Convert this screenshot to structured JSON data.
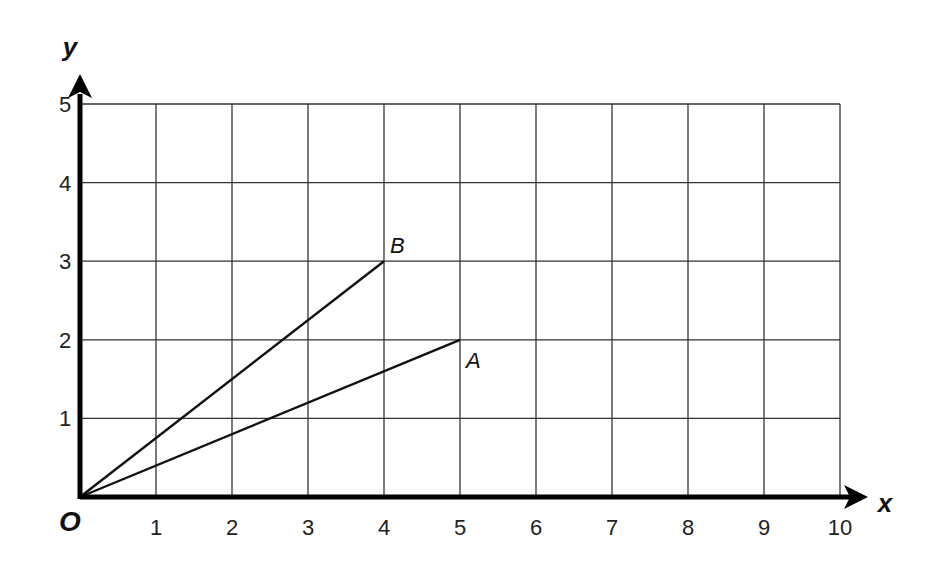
{
  "diagram": {
    "type": "coordinate-grid",
    "x_axis": {
      "label": "x",
      "min": 0,
      "max": 10,
      "ticks": [
        "1",
        "2",
        "3",
        "4",
        "5",
        "6",
        "7",
        "8",
        "9",
        "10"
      ]
    },
    "y_axis": {
      "label": "y",
      "min": 0,
      "max": 5,
      "ticks": [
        "1",
        "2",
        "3",
        "4",
        "5"
      ]
    },
    "origin_label": "O",
    "points": [
      {
        "label": "B",
        "x": 4,
        "y": 3
      },
      {
        "label": "A",
        "x": 5,
        "y": 2
      }
    ],
    "segments": [
      {
        "from": "O",
        "to": "B"
      },
      {
        "from": "O",
        "to": "A"
      }
    ],
    "colors": {
      "grid": "#333333",
      "axis": "#000000",
      "line": "#111111"
    }
  }
}
